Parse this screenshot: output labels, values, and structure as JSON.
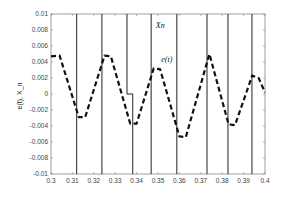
{
  "chart_data": {
    "type": "line",
    "title": "",
    "xlabel": "",
    "ylabel": "e(t), X_n",
    "xlim": [
      0.3,
      0.4
    ],
    "ylim": [
      -0.01,
      0.01
    ],
    "grid": false,
    "legend": null,
    "x_ticks": [
      "0.3",
      "0.31",
      "0.32",
      "0.33",
      "0.34",
      "0.35",
      "0.36",
      "0.37",
      "0.38",
      "0.39",
      "0.4"
    ],
    "y_ticks": [
      "0.01",
      "0.008",
      "0.006",
      "0.004",
      "0.002",
      "0",
      "-0.002",
      "-0.004",
      "-0.006",
      "-0.008",
      "-0.01"
    ],
    "annotations": [
      {
        "text": "Xn",
        "x": 0.349,
        "y": 0.0082
      },
      {
        "text": "e(t)",
        "x": 0.3515,
        "y": 0.004
      }
    ],
    "series": [
      {
        "name": "e(t)",
        "style": "dashed",
        "color": "#111111",
        "x": [
          0.3,
          0.304,
          0.313,
          0.316,
          0.325,
          0.328,
          0.337,
          0.34,
          0.348,
          0.351,
          0.36,
          0.363,
          0.374,
          0.383,
          0.386,
          0.394,
          0.397,
          0.4
        ],
        "y": [
          0.0047,
          0.0048,
          -0.0029,
          -0.0029,
          0.0048,
          0.0047,
          -0.0037,
          -0.0037,
          0.0032,
          0.0031,
          -0.0053,
          -0.0054,
          0.005,
          -0.0038,
          -0.0039,
          0.0023,
          0.002,
          0.0002
        ]
      },
      {
        "name": "Xn",
        "style": "solid",
        "color": "#222222",
        "switch_times": [
          0.312,
          0.3238,
          0.3355,
          0.3382,
          0.3468,
          0.3588,
          0.3729,
          0.3827,
          0.3939
        ],
        "step": {
          "x_from": 0.3355,
          "x_to": 0.3382,
          "y": 0.0
        }
      }
    ]
  }
}
